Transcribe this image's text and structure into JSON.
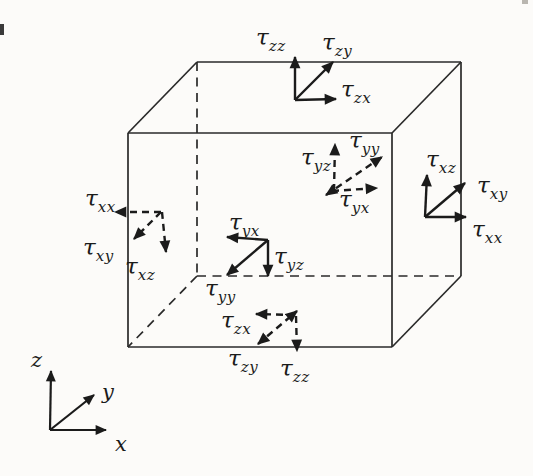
{
  "figure": {
    "kind": "stress-components-on-cubic-element",
    "background": "#fcfbf9",
    "ink": "#1e1e1e"
  },
  "symbols": {
    "tau": "τ"
  },
  "clusters": {
    "top": {
      "line_style": "solid",
      "items": [
        {
          "base": "τ",
          "sub": "zz"
        },
        {
          "base": "τ",
          "sub": "zy"
        },
        {
          "base": "τ",
          "sub": "zx"
        }
      ]
    },
    "back": {
      "line_style": "dashed",
      "items": [
        {
          "base": "τ",
          "sub": "yz"
        },
        {
          "base": "τ",
          "sub": "yy"
        },
        {
          "base": "τ",
          "sub": "yx"
        }
      ]
    },
    "right": {
      "line_style": "solid",
      "items": [
        {
          "base": "τ",
          "sub": "xz"
        },
        {
          "base": "τ",
          "sub": "xy"
        },
        {
          "base": "τ",
          "sub": "xx"
        }
      ]
    },
    "left": {
      "line_style": "dashed",
      "items": [
        {
          "base": "τ",
          "sub": "xx"
        },
        {
          "base": "τ",
          "sub": "xy"
        },
        {
          "base": "τ",
          "sub": "xz"
        }
      ]
    },
    "front": {
      "line_style": "solid",
      "items": [
        {
          "base": "τ",
          "sub": "yx"
        },
        {
          "base": "τ",
          "sub": "yz"
        },
        {
          "base": "τ",
          "sub": "yy"
        }
      ]
    },
    "bottom": {
      "line_style": "dashed",
      "items": [
        {
          "base": "τ",
          "sub": "zx"
        },
        {
          "base": "τ",
          "sub": "zy"
        },
        {
          "base": "τ",
          "sub": "zz"
        }
      ]
    }
  },
  "axes": {
    "x_label": "x",
    "y_label": "y",
    "z_label": "z"
  }
}
